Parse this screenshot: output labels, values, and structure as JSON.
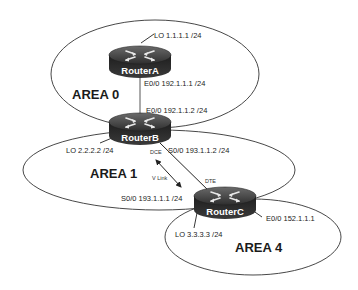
{
  "diagram": {
    "type": "ospf-network-topology",
    "areas": [
      {
        "id": "area0",
        "label": "AREA 0"
      },
      {
        "id": "area1",
        "label": "AREA 1"
      },
      {
        "id": "area4",
        "label": "AREA 4"
      }
    ],
    "routers": [
      {
        "id": "routerA",
        "name": "RouterA"
      },
      {
        "id": "routerB",
        "name": "RouterB"
      },
      {
        "id": "routerC",
        "name": "RouterC"
      }
    ],
    "interfaces": {
      "routerA_lo": "LO 1.1.1.1 /24",
      "routerA_e0": "E0/0 192.1.1.1 /24",
      "routerB_e0": "E0/0 192.1.1.2 /24",
      "routerB_lo": "LO 2.2.2.2 /24",
      "routerB_s0": "S0/0 193.1.1.2 /24",
      "routerC_s0": "S0/0 193.1.1.1 /24",
      "routerC_lo": "LO 3.3.3.3 /24",
      "routerC_e0": "E0/0 152.1.1.1"
    },
    "link_labels": {
      "dce": "DCE",
      "dte": "DTE",
      "vlink": "V Link"
    },
    "colors": {
      "router_body": "#2b2b2b",
      "router_top": "#4a4a4a",
      "line": "#333333",
      "background": "#ffffff"
    }
  }
}
